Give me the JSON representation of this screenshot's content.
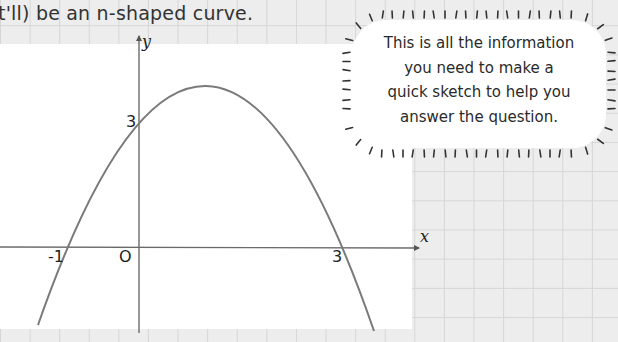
{
  "intro_text": "t'll) be an n-shaped curve.",
  "axes": {
    "x_label": "x",
    "y_label": "y",
    "origin_label": "O"
  },
  "points": {
    "x_intercept_left": "-1",
    "x_intercept_right": "3",
    "y_intercept": "3"
  },
  "callout": {
    "lines": [
      "This is all the information",
      "you need to make a",
      "quick sketch to help you",
      "answer the question."
    ]
  },
  "colors": {
    "curve": "#7a7a7a",
    "axis": "#6a6a6a",
    "grid": "#d6d6d6",
    "paper": "#ededed"
  },
  "chart_data": {
    "type": "line",
    "title": "",
    "x": [
      -1.5,
      -1,
      0,
      1,
      2,
      3,
      3.5
    ],
    "series": [
      {
        "name": "y = -x^2 + 2x + 3",
        "values": [
          -2.25,
          0,
          3,
          4,
          3,
          0,
          -2.25
        ]
      }
    ],
    "annotations": [
      "x-intercepts at -1 and 3",
      "y-intercept at 3",
      "origin O"
    ],
    "xlabel": "x",
    "ylabel": "y",
    "grid": false
  }
}
